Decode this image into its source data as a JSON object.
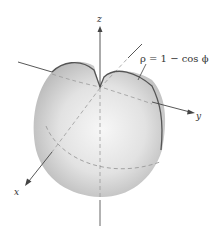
{
  "figure": {
    "axes": {
      "x_label": "x",
      "y_label": "y",
      "z_label": "z"
    },
    "equation_label": "ρ = 1 − cos ϕ",
    "colors": {
      "surface_light": "#f4f4f4",
      "surface_dark": "#b8b8b8",
      "curve": "#555555",
      "axis": "#444444",
      "dashed": "#9a9a9a"
    }
  }
}
